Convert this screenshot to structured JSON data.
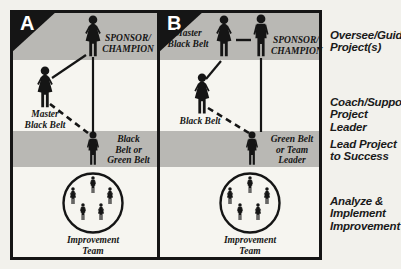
{
  "colors": {
    "band_gray": "#b9b8b4",
    "ink_black": "#151515",
    "paper": "#f2f1ec",
    "letter_white": "#ffffff"
  },
  "panel_a": {
    "letter": "A",
    "sponsor_champion": "SPONSOR/\nCHAMPION",
    "master_black_belt": "Master\nBlack Belt",
    "black_or_green_belt": "Black\nBelt or\nGreen Belt",
    "improvement_team": "Improvement\nTeam"
  },
  "panel_b": {
    "letter": "B",
    "master_black_belt": "Master\nBlack Belt",
    "sponsor_champion": "SPONSOR/\nCHAMPION",
    "black_belt": "Black Belt",
    "green_belt_or_team_leader": "Green Belt\nor Team\nLeader",
    "improvement_team": "Improvement\nTeam"
  },
  "right_labels": {
    "oversee": "Oversee/Guide\nProject(s)",
    "coach": "Coach/Support\nProject Leader",
    "lead": "Lead Project\nto Success",
    "analyze": "Analyze &\nImplement\nImprovement"
  }
}
